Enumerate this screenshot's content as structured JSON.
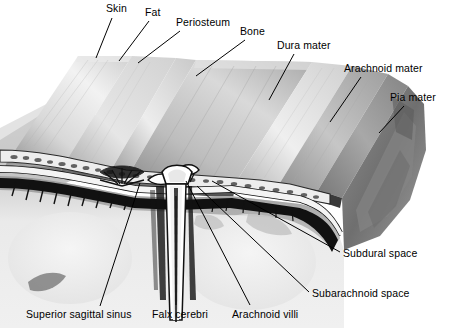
{
  "figure": {
    "type": "anatomical-illustration",
    "width": 449,
    "height": 328,
    "background_color": "#ffffff",
    "line_color": "#000000",
    "label_color": "#000000",
    "label_font_size_px": 10.5
  },
  "labels": [
    {
      "id": "skin",
      "text": "Skin",
      "x": 106,
      "y": 3,
      "leader": {
        "x1": 112,
        "y1": 18,
        "x2": 96,
        "y2": 58
      }
    },
    {
      "id": "fat",
      "text": "Fat",
      "x": 145,
      "y": 7,
      "leader": {
        "x1": 149,
        "y1": 21,
        "x2": 119,
        "y2": 61
      }
    },
    {
      "id": "periosteum",
      "text": "Periosteum",
      "x": 176,
      "y": 17,
      "leader": {
        "x1": 180,
        "y1": 31,
        "x2": 138,
        "y2": 63
      }
    },
    {
      "id": "bone",
      "text": "Bone",
      "x": 240,
      "y": 26,
      "leader": {
        "x1": 245,
        "y1": 40,
        "x2": 196,
        "y2": 76
      }
    },
    {
      "id": "dura-mater",
      "text": "Dura mater",
      "x": 277,
      "y": 40,
      "leader": {
        "x1": 294,
        "y1": 54,
        "x2": 269,
        "y2": 100
      }
    },
    {
      "id": "arachnoid-mater",
      "text": "Arachnoid mater",
      "x": 344,
      "y": 63,
      "leader": {
        "x1": 361,
        "y1": 77,
        "x2": 330,
        "y2": 122
      }
    },
    {
      "id": "pia-mater",
      "text": "Pia mater",
      "x": 390,
      "y": 92,
      "leader": {
        "x1": 404,
        "y1": 106,
        "x2": 379,
        "y2": 133
      }
    },
    {
      "id": "subdural-space",
      "text": "Subdural space",
      "x": 343,
      "y": 248,
      "leader": {
        "x1": 340,
        "y1": 252,
        "x2": 212,
        "y2": 181
      }
    },
    {
      "id": "subarachnoid-space",
      "text": "Subarachnoid space",
      "x": 312,
      "y": 288,
      "leader": {
        "x1": 309,
        "y1": 292,
        "x2": 197,
        "y2": 186
      }
    },
    {
      "id": "superior-sagittal-sinus",
      "text": "Superior sagittal sinus",
      "x": 26,
      "y": 309,
      "leader": {
        "x1": 100,
        "y1": 306,
        "x2": 140,
        "y2": 183
      }
    },
    {
      "id": "falx-cerebri",
      "text": "Falx cerebri",
      "x": 152,
      "y": 309,
      "leader": {
        "x1": 176,
        "y1": 305,
        "x2": 176,
        "y2": 196
      }
    },
    {
      "id": "arachnoid-villi",
      "text": "Arachnoid villi",
      "x": 232,
      "y": 309,
      "leader": {
        "x1": 250,
        "y1": 305,
        "x2": 186,
        "y2": 181
      }
    }
  ],
  "structures": {
    "flaps": [
      {
        "id": "skin-flap",
        "name": "Skin flap"
      },
      {
        "id": "fat-flap",
        "name": "Fat flap"
      },
      {
        "id": "periosteum-flap",
        "name": "Periosteum flap"
      },
      {
        "id": "bone-flap",
        "name": "Bone flap"
      },
      {
        "id": "dura-flap",
        "name": "Dura mater flap"
      },
      {
        "id": "arachnoid-flap",
        "name": "Arachnoid mater flap"
      },
      {
        "id": "pia-flap",
        "name": "Pia mater flap"
      }
    ],
    "brain": {
      "id": "brain-tissue",
      "name": "Cerebral hemispheres"
    },
    "falx": {
      "id": "falx-cerebri-structure",
      "name": "Falx cerebri"
    },
    "sinus": {
      "id": "superior-sagittal-sinus-structure",
      "name": "Superior sagittal sinus"
    },
    "villi": {
      "id": "arachnoid-villi-structure",
      "name": "Arachnoid villi"
    },
    "diploe": {
      "id": "diploe-trabeculae",
      "name": "Diploe of skull bone"
    }
  }
}
